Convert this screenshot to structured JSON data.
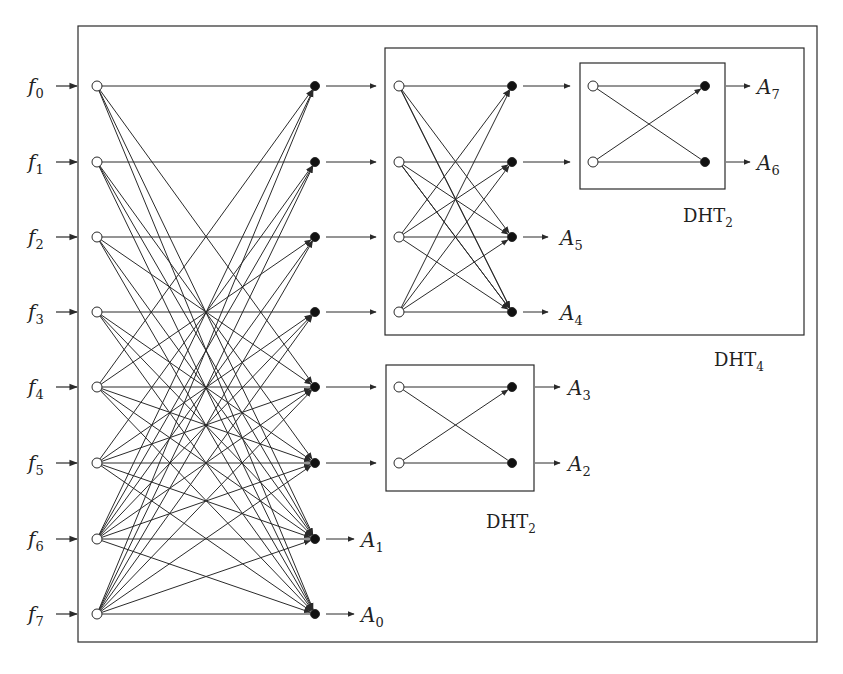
{
  "diagram": {
    "colors": {
      "stroke": "#2a2a2a",
      "node_fill": "#111111",
      "background": "#ffffff"
    },
    "inputs": [
      {
        "base": "f",
        "sub": "0"
      },
      {
        "base": "f",
        "sub": "1"
      },
      {
        "base": "f",
        "sub": "2"
      },
      {
        "base": "f",
        "sub": "3"
      },
      {
        "base": "f",
        "sub": "4"
      },
      {
        "base": "f",
        "sub": "5"
      },
      {
        "base": "f",
        "sub": "6"
      },
      {
        "base": "f",
        "sub": "7"
      }
    ],
    "outputs": {
      "A7": {
        "base": "A",
        "sub": "7"
      },
      "A6": {
        "base": "A",
        "sub": "6"
      },
      "A5": {
        "base": "A",
        "sub": "5"
      },
      "A4": {
        "base": "A",
        "sub": "4"
      },
      "A3": {
        "base": "A",
        "sub": "3"
      },
      "A2": {
        "base": "A",
        "sub": "2"
      },
      "A1": {
        "base": "A",
        "sub": "1"
      },
      "A0": {
        "base": "A",
        "sub": "0"
      }
    },
    "blocks": {
      "dht4": {
        "base": "DHT",
        "sub": "4"
      },
      "dht2_top": {
        "base": "DHT",
        "sub": "2"
      },
      "dht2_bottom": {
        "base": "DHT",
        "sub": "2"
      }
    }
  }
}
